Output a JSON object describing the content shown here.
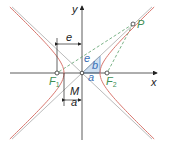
{
  "diagram": {
    "colors": {
      "axes": "#333333",
      "hyperbola": "#d9776f",
      "asymptote": "#a8a8a8",
      "focal_lines": "#5aa06a",
      "triangle_fill": "#cfe0f2",
      "triangle_stroke": "#5b8fc9",
      "label_blue": "#3a6fb5",
      "label_green": "#3f8f55",
      "label_dark": "#222222"
    },
    "geometry": {
      "origin": [
        82,
        73
      ],
      "a": 18,
      "b": 17,
      "e": 25,
      "y_extent": 66,
      "point_P": [
        133,
        24
      ]
    },
    "labels": {
      "x_axis": "x",
      "y_axis": "y",
      "focus1": "F",
      "focus1_sub": "1",
      "focus2": "F",
      "focus2_sub": "2",
      "point": "P",
      "center": "M",
      "dim_e": "e",
      "dim_a": "a",
      "tri_e": "e",
      "tri_b": "b",
      "tri_a": "a"
    }
  }
}
